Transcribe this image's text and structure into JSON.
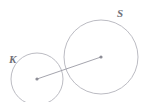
{
  "figure": {
    "type": "geometry-diagram",
    "width": 147,
    "height": 102,
    "background_color": "#ffffff",
    "stroke_color": "#b3b3bb",
    "line_color": "#9a9aa4",
    "dot_color": "#8d8d96",
    "label_color": "#6f6f78"
  },
  "circles": [
    {
      "id": "circle-k",
      "label": "K",
      "cx": 37,
      "cy": 79,
      "r": 26,
      "label_x": 9,
      "label_y": 63,
      "role": "small-circle"
    },
    {
      "id": "circle-s",
      "label": "S",
      "cx": 101,
      "cy": 57,
      "r": 37,
      "label_x": 117,
      "label_y": 17,
      "role": "large-circle"
    }
  ],
  "segment": {
    "id": "center-to-center-segment",
    "x1": 37,
    "y1": 79,
    "x2": 101,
    "y2": 57
  },
  "centers": [
    {
      "id": "center-dot-k",
      "cx": 37,
      "cy": 79,
      "r": 1.6
    },
    {
      "id": "center-dot-s",
      "cx": 101,
      "cy": 57,
      "r": 1.6
    }
  ]
}
